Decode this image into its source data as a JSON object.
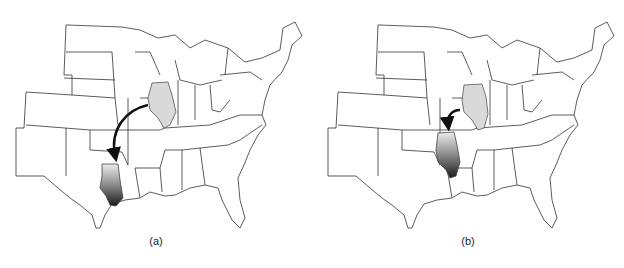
{
  "figure": {
    "panels": [
      {
        "id": "a",
        "caption": "(a)",
        "description": "Illinois moved far south to the Gulf coast (Louisiana/Texas border)"
      },
      {
        "id": "b",
        "caption": "(b)",
        "description": "Illinois moved a short distance southwest to Arkansas region"
      }
    ],
    "colors": {
      "state_fill": "#ffffff",
      "state_stroke": "#333333",
      "illinois_original": "#d9d9d9",
      "gradient_top": "#e8e8e8",
      "gradient_bottom": "#1a1a1a",
      "arrow": "#111111"
    }
  }
}
